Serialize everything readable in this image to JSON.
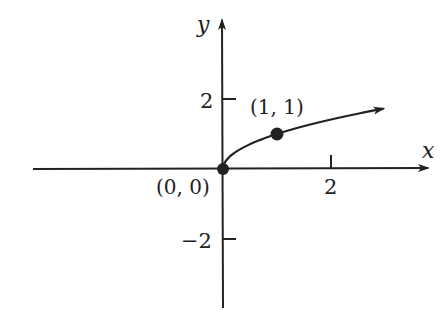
{
  "chart_data": {
    "type": "line",
    "title": "",
    "function": "y = sqrt(x)",
    "xlabel": "x",
    "ylabel": "y",
    "x_ticks": [
      2
    ],
    "x_tick_labels": [
      "2"
    ],
    "y_ticks": [
      2,
      -2
    ],
    "y_tick_labels": [
      "2",
      "−2"
    ],
    "xlim": [
      -3.5,
      3.9
    ],
    "ylim": [
      -4,
      4.2
    ],
    "grid": false,
    "legend": null,
    "series": [
      {
        "name": "y = √x",
        "x": [
          0,
          0.25,
          0.5,
          1,
          1.5,
          2,
          2.5,
          3
        ],
        "y": [
          0,
          0.5,
          0.707,
          1,
          1.225,
          1.414,
          1.581,
          1.732
        ],
        "end_arrow": true
      }
    ],
    "points": [
      {
        "x": 0,
        "y": 0,
        "label": "(0, 0)"
      },
      {
        "x": 1,
        "y": 1,
        "label": "(1, 1)"
      }
    ],
    "annotations": [
      "(0, 0)",
      "(1, 1)"
    ]
  },
  "labels": {
    "x_axis": "x",
    "y_axis": "y",
    "x_tick_2": "2",
    "y_tick_pos2": "2",
    "y_tick_neg2": "−2",
    "point_origin": "(0, 0)",
    "point_one": "(1, 1)"
  },
  "colors": {
    "ink": "#222222",
    "background": "#ffffff"
  }
}
